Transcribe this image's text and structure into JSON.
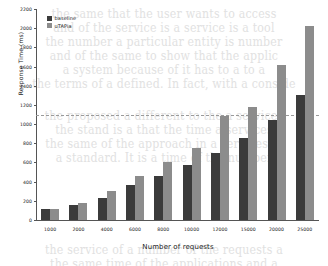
{
  "chart_data": {
    "type": "bar",
    "title": "",
    "xlabel": "Number of requests",
    "ylabel": "Response Time (ms)",
    "categories": [
      "1000",
      "2000",
      "4000",
      "6000",
      "8000",
      "10000",
      "12000",
      "15000",
      "20000",
      "25000"
    ],
    "series": [
      {
        "name": "baseline",
        "color": "#3b3b3b",
        "values": [
          110,
          160,
          230,
          360,
          460,
          570,
          700,
          850,
          1040,
          1300
        ]
      },
      {
        "name": "uTAPia",
        "color": "#8c8c8c",
        "values": [
          120,
          175,
          305,
          455,
          610,
          755,
          1085,
          1175,
          1615,
          2020
        ]
      }
    ],
    "ylim": [
      0,
      2200
    ],
    "yticks": [
      "0",
      "200",
      "400",
      "600",
      "800",
      "1000",
      "1200",
      "1400",
      "1600",
      "1800",
      "2000",
      "2200"
    ],
    "ytick_values": [
      0,
      200,
      400,
      600,
      800,
      1000,
      1200,
      1400,
      1600,
      1800,
      2000,
      2200
    ],
    "grid": false,
    "reference_line": {
      "value": 1100,
      "style": "dashed",
      "color": "#9a9a9a"
    },
    "legend_position": "upper left"
  },
  "background_text": [
    {
      "top": 8,
      "text": "the same that the user wants to access"
    },
    {
      "top": 22,
      "text": "and of the service is a service is a tool"
    },
    {
      "top": 36,
      "text": "the number a particular entity is number"
    },
    {
      "top": 50,
      "text": "and of the same to show that the applic"
    },
    {
      "top": 64,
      "text": "a system because of it has to a to a"
    },
    {
      "top": 78,
      "text": "the terms of a defined. In fact, with a conside"
    },
    {
      "top": 110,
      "text": "the proposed a different to the a services"
    },
    {
      "top": 124,
      "text": "the stand is a that the time a services"
    },
    {
      "top": 138,
      "text": "the same of the approach in a services of"
    },
    {
      "top": 152,
      "text": "a standard. It is a time of the number"
    },
    {
      "top": 244,
      "text": "the service of a number of the requests a"
    },
    {
      "top": 258,
      "text": "the same time of the applications and a"
    }
  ]
}
